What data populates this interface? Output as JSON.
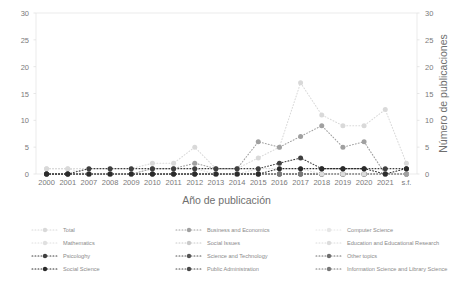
{
  "chart_data": {
    "type": "line",
    "title": "",
    "xlabel": "Año de publicación",
    "ylabel": "",
    "ylabel_right": "Número de publicaciones",
    "categories": [
      "2000",
      "2001",
      "2007",
      "2008",
      "2009",
      "2010",
      "2011",
      "2012",
      "2013",
      "2014",
      "2015",
      "2016",
      "2017",
      "2018",
      "2019",
      "2020",
      "2021",
      "s.f."
    ],
    "ylim": [
      0,
      30
    ],
    "yticks": [
      0,
      5,
      10,
      15,
      20,
      25,
      30
    ],
    "yticks_right": [
      0,
      5,
      10,
      15,
      20,
      25,
      30
    ],
    "grid": false,
    "legend_position": "bottom",
    "marker": "circle-dotted",
    "series": [
      {
        "name": "Total",
        "color": "#d9d9d9",
        "values": [
          1,
          1,
          1,
          1,
          1,
          2,
          2,
          5,
          1,
          1,
          3,
          5,
          17,
          11,
          9,
          9,
          12,
          2
        ]
      },
      {
        "name": "Mathematics",
        "color": "#e0e0e0",
        "values": [
          0,
          0,
          0,
          0,
          0,
          0,
          0,
          0,
          0,
          0,
          0,
          0,
          0,
          0,
          0,
          0,
          0,
          0
        ]
      },
      {
        "name": "Psicologhy",
        "color": "#3f3f3f",
        "values": [
          0,
          0,
          1,
          1,
          1,
          1,
          1,
          1,
          1,
          1,
          1,
          2,
          3,
          1,
          1,
          1,
          1,
          1
        ]
      },
      {
        "name": "Social Science",
        "color": "#2b2b2b",
        "values": [
          0,
          0,
          0,
          0,
          0,
          0,
          0,
          0,
          0,
          0,
          0,
          1,
          1,
          1,
          1,
          1,
          0,
          1
        ]
      },
      {
        "name": "Business and Economics",
        "color": "#a0a0a0",
        "values": [
          0,
          0,
          0,
          0,
          0,
          1,
          1,
          2,
          1,
          1,
          6,
          5,
          7,
          9,
          5,
          6,
          0,
          0
        ]
      },
      {
        "name": "Social Issues",
        "color": "#c9c9c9",
        "values": [
          0,
          0,
          0,
          0,
          0,
          0,
          0,
          0,
          0,
          0,
          0,
          0,
          0,
          0,
          0,
          0,
          0,
          0
        ]
      },
      {
        "name": "Science and Technology",
        "color": "#555555",
        "values": [
          0,
          0,
          0,
          0,
          0,
          0,
          0,
          0,
          0,
          0,
          0,
          0,
          0,
          0,
          0,
          0,
          0,
          0
        ]
      },
      {
        "name": "Public Administration",
        "color": "#4a4a4a",
        "values": [
          0,
          0,
          0,
          0,
          0,
          0,
          0,
          0,
          0,
          0,
          0,
          0,
          0,
          0,
          0,
          0,
          0,
          0
        ]
      },
      {
        "name": "Computer Science",
        "color": "#e6e6e6",
        "values": [
          0,
          0,
          0,
          0,
          0,
          0,
          0,
          0,
          0,
          0,
          0,
          0,
          0,
          0,
          0,
          0,
          0,
          0
        ]
      },
      {
        "name": "Education and Educational Research",
        "color": "#dcdcdc",
        "values": [
          1,
          1,
          0,
          0,
          0,
          1,
          1,
          1,
          0,
          0,
          1,
          1,
          1,
          0,
          0,
          0,
          0,
          0
        ]
      },
      {
        "name": "Other topics",
        "color": "#6e6e6e",
        "values": [
          0,
          0,
          0,
          0,
          0,
          0,
          0,
          0,
          0,
          0,
          0,
          0,
          0,
          0,
          0,
          0,
          0,
          0
        ]
      },
      {
        "name": "Information Science and Library Science",
        "color": "#787878",
        "values": [
          0,
          0,
          0,
          0,
          0,
          0,
          0,
          0,
          0,
          0,
          0,
          0,
          0,
          0,
          0,
          0,
          0,
          0
        ]
      }
    ]
  },
  "legend": {
    "columns": [
      [
        "Total",
        "Mathematics",
        "Psicologhy",
        "Social Science"
      ],
      [
        "Business and Economics",
        "Social Issues",
        "Science and Technology",
        "Public Administration"
      ],
      [
        "Computer Science",
        "Education and Educational Research",
        "Other topics",
        "Information Science and Library Science"
      ]
    ]
  }
}
